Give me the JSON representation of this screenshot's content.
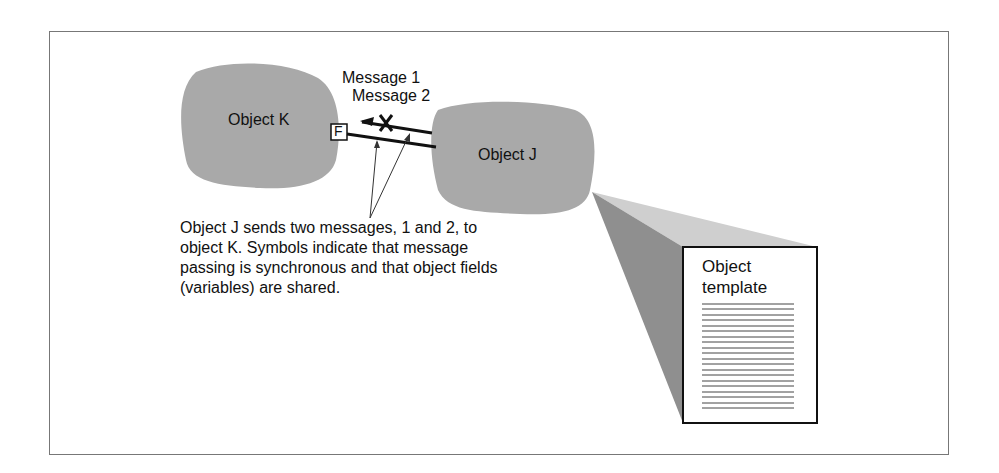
{
  "diagram": {
    "objects": [
      {
        "id": "K",
        "label": "Object K"
      },
      {
        "id": "J",
        "label": "Object J"
      }
    ],
    "messages": [
      {
        "label": "Message 1"
      },
      {
        "label": "Message 2"
      }
    ],
    "field_symbol": "F",
    "caption": [
      "Object J sends two messages, 1 and 2, to",
      "object K. Symbols indicate that message",
      "passing is synchronous and that object fields",
      "(variables) are shared."
    ],
    "template": {
      "title_line1": "Object",
      "title_line2": "template"
    },
    "colors": {
      "blob": "#a9a9a9",
      "cone_light": "#cfcfcf",
      "cone_dark": "#8f8f8f",
      "border": "#777777"
    }
  }
}
